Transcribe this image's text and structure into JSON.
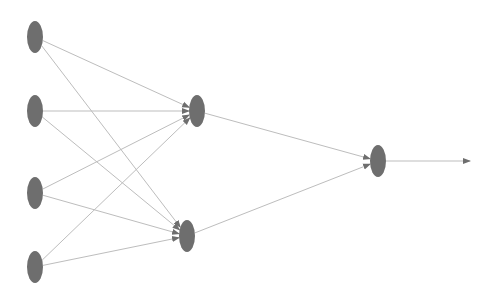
{
  "diagram": {
    "type": "feedforward-neural-network",
    "colors": {
      "background": "#ffffff",
      "node_fill": "#6e6e6e",
      "edge": "#bdbdbd",
      "arrowhead": "#6e6e6e"
    },
    "node_size": {
      "rx": 8,
      "ry": 16
    },
    "layers": [
      {
        "name": "input",
        "nodes": [
          {
            "id": "i1",
            "x": 35,
            "y": 37
          },
          {
            "id": "i2",
            "x": 35,
            "y": 111
          },
          {
            "id": "i3",
            "x": 35,
            "y": 193
          },
          {
            "id": "i4",
            "x": 35,
            "y": 267
          }
        ]
      },
      {
        "name": "hidden",
        "nodes": [
          {
            "id": "h1",
            "x": 197,
            "y": 111
          },
          {
            "id": "h2",
            "x": 187,
            "y": 236
          }
        ]
      },
      {
        "name": "output",
        "nodes": [
          {
            "id": "o1",
            "x": 378,
            "y": 161
          }
        ]
      }
    ],
    "edges": [
      {
        "from": "i1",
        "to": "h1"
      },
      {
        "from": "i1",
        "to": "h2"
      },
      {
        "from": "i2",
        "to": "h1"
      },
      {
        "from": "i2",
        "to": "h2"
      },
      {
        "from": "i3",
        "to": "h1"
      },
      {
        "from": "i3",
        "to": "h2"
      },
      {
        "from": "i4",
        "to": "h1"
      },
      {
        "from": "i4",
        "to": "h2"
      },
      {
        "from": "h1",
        "to": "o1"
      },
      {
        "from": "h2",
        "to": "o1"
      }
    ],
    "output_arrow": {
      "from": "o1",
      "x2": 470,
      "y2": 161
    }
  }
}
